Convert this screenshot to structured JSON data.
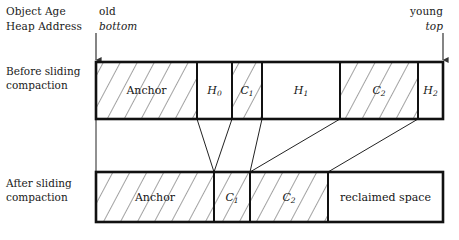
{
  "header": {
    "object_age_label": "Object Age",
    "heap_address_label": "Heap Address",
    "old_label": "old",
    "bottom_label": "bottom",
    "young_label": "young",
    "top_label": "top"
  },
  "rows": {
    "before_label": "Before sliding compaction",
    "after_label": "After sliding compaction"
  },
  "colors": {
    "stroke": "#111111",
    "hatch": "#555555",
    "background": "#ffffff",
    "text": "#151515"
  },
  "diagram": {
    "type": "memory-layout",
    "bar_left": 96,
    "bar_right": 443,
    "before": {
      "y_top": 62,
      "y_bottom": 119,
      "segments": [
        {
          "label": "Anchor",
          "sub": "",
          "x0": 96,
          "x1": 197,
          "hatched": true
        },
        {
          "label": "H",
          "sub": "0",
          "x0": 197,
          "x1": 232,
          "hatched": false
        },
        {
          "label": "C",
          "sub": "1",
          "x0": 232,
          "x1": 262,
          "hatched": true
        },
        {
          "label": "H",
          "sub": "1",
          "x0": 262,
          "x1": 340,
          "hatched": false
        },
        {
          "label": "C",
          "sub": "2",
          "x0": 340,
          "x1": 418,
          "hatched": true
        },
        {
          "label": "H",
          "sub": "2",
          "x0": 418,
          "x1": 443,
          "hatched": false
        }
      ]
    },
    "after": {
      "y_top": 172,
      "y_bottom": 222,
      "segments": [
        {
          "label": "Anchor",
          "sub": "",
          "x0": 96,
          "x1": 214,
          "hatched": true
        },
        {
          "label": "C",
          "sub": "1",
          "x0": 214,
          "x1": 250,
          "hatched": true
        },
        {
          "label": "C",
          "sub": "2",
          "x0": 250,
          "x1": 328,
          "hatched": true
        },
        {
          "label": "reclaimed space",
          "sub": "",
          "x0": 328,
          "x1": 443,
          "hatched": false
        }
      ]
    },
    "connectors": [
      {
        "x_top": 96,
        "x_bottom": 96
      },
      {
        "x_top": 197,
        "x_bottom": 214
      },
      {
        "x_top": 232,
        "x_bottom": 214
      },
      {
        "x_top": 262,
        "x_bottom": 250
      },
      {
        "x_top": 340,
        "x_bottom": 250
      },
      {
        "x_top": 418,
        "x_bottom": 328
      }
    ],
    "arrows": [
      {
        "name": "bottom-arrow",
        "x": 96,
        "y0": 33,
        "y1": 60
      },
      {
        "name": "top-arrow",
        "x": 443,
        "y0": 33,
        "y1": 60
      }
    ]
  }
}
